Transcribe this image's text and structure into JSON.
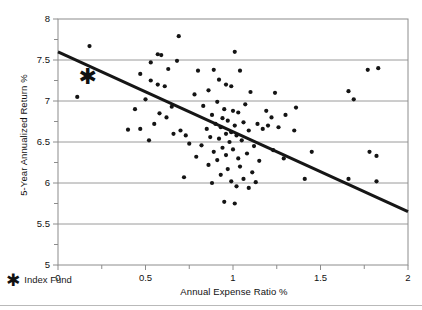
{
  "chart_data": {
    "type": "scatter",
    "title": "",
    "xlabel": "Annual Expense Ratio %",
    "ylabel": "5-Year Annualized Return %",
    "xlim": [
      0,
      2
    ],
    "ylim": [
      5,
      8
    ],
    "xticks": [
      0,
      0.5,
      1,
      1.5,
      2
    ],
    "xtick_labels": [
      "0",
      "0.5",
      "1",
      "1.5",
      "2"
    ],
    "yticks": [
      5,
      5.5,
      6,
      6.5,
      7,
      7.5,
      8
    ],
    "ytick_labels": [
      "5",
      "5.5",
      "6",
      "6.5",
      "7",
      "7.5",
      "8"
    ],
    "y_minor_ticks": [
      5.25,
      5.75,
      6.25,
      6.75,
      7.25,
      7.75
    ],
    "x_minor_ticks": [
      0.25,
      0.75,
      1.25,
      1.75
    ],
    "grid": "horizontal",
    "legend_position": "below-left",
    "series": [
      {
        "name": "Funds",
        "marker": "circle",
        "color": "#141414",
        "points": [
          [
            0.18,
            7.67
          ],
          [
            0.11,
            7.05
          ],
          [
            0.4,
            6.65
          ],
          [
            0.69,
            7.79
          ],
          [
            0.57,
            7.57
          ],
          [
            0.59,
            7.56
          ],
          [
            0.53,
            7.47
          ],
          [
            0.68,
            7.49
          ],
          [
            0.63,
            7.39
          ],
          [
            0.47,
            7.33
          ],
          [
            0.53,
            7.25
          ],
          [
            0.57,
            7.2
          ],
          [
            0.61,
            7.18
          ],
          [
            0.5,
            7.02
          ],
          [
            0.65,
            6.93
          ],
          [
            0.44,
            6.9
          ],
          [
            0.58,
            6.85
          ],
          [
            0.62,
            6.8
          ],
          [
            0.55,
            6.72
          ],
          [
            0.47,
            6.66
          ],
          [
            0.7,
            6.64
          ],
          [
            0.66,
            6.6
          ],
          [
            0.73,
            6.58
          ],
          [
            0.52,
            6.52
          ],
          [
            0.8,
            7.37
          ],
          [
            0.89,
            7.38
          ],
          [
            1.01,
            7.6
          ],
          [
            1.04,
            7.37
          ],
          [
            0.92,
            7.26
          ],
          [
            0.96,
            7.2
          ],
          [
            0.99,
            7.18
          ],
          [
            0.86,
            7.13
          ],
          [
            1.1,
            7.11
          ],
          [
            0.78,
            7.08
          ],
          [
            0.91,
            6.99
          ],
          [
            1.07,
            6.96
          ],
          [
            0.83,
            6.94
          ],
          [
            0.95,
            6.9
          ],
          [
            1.0,
            6.88
          ],
          [
            1.03,
            6.86
          ],
          [
            0.88,
            6.83
          ],
          [
            0.94,
            6.79
          ],
          [
            0.97,
            6.76
          ],
          [
            1.06,
            6.74
          ],
          [
            0.9,
            6.72
          ],
          [
            1.01,
            6.7
          ],
          [
            0.93,
            6.68
          ],
          [
            0.85,
            6.66
          ],
          [
            1.09,
            6.64
          ],
          [
            0.99,
            6.62
          ],
          [
            0.96,
            6.6
          ],
          [
            1.02,
            6.58
          ],
          [
            0.87,
            6.56
          ],
          [
            0.92,
            6.54
          ],
          [
            1.05,
            6.52
          ],
          [
            0.98,
            6.5
          ],
          [
            0.75,
            6.48
          ],
          [
            0.82,
            6.46
          ],
          [
            1.12,
            6.45
          ],
          [
            0.94,
            6.43
          ],
          [
            1.0,
            6.41
          ],
          [
            0.89,
            6.38
          ],
          [
            1.08,
            6.36
          ],
          [
            0.96,
            6.34
          ],
          [
            0.79,
            6.32
          ],
          [
            1.03,
            6.3
          ],
          [
            0.91,
            6.28
          ],
          [
            1.15,
            6.27
          ],
          [
            0.86,
            6.22
          ],
          [
            1.04,
            6.2
          ],
          [
            0.97,
            6.17
          ],
          [
            1.11,
            6.13
          ],
          [
            0.93,
            6.1
          ],
          [
            0.72,
            6.07
          ],
          [
            1.06,
            6.05
          ],
          [
            0.99,
            6.02
          ],
          [
            1.13,
            6.01
          ],
          [
            0.88,
            6.0
          ],
          [
            1.02,
            5.96
          ],
          [
            1.09,
            5.94
          ],
          [
            0.95,
            5.77
          ],
          [
            1.01,
            5.75
          ],
          [
            1.24,
            7.1
          ],
          [
            1.36,
            6.92
          ],
          [
            1.19,
            6.88
          ],
          [
            1.3,
            6.83
          ],
          [
            1.22,
            6.8
          ],
          [
            1.14,
            6.72
          ],
          [
            1.2,
            6.7
          ],
          [
            1.26,
            6.68
          ],
          [
            1.17,
            6.66
          ],
          [
            1.35,
            6.64
          ],
          [
            1.23,
            6.4
          ],
          [
            1.45,
            6.38
          ],
          [
            1.29,
            6.3
          ],
          [
            1.41,
            6.05
          ],
          [
            1.66,
            7.12
          ],
          [
            1.83,
            7.4
          ],
          [
            1.77,
            7.38
          ],
          [
            1.69,
            7.02
          ],
          [
            1.78,
            6.38
          ],
          [
            1.82,
            6.33
          ],
          [
            1.66,
            6.05
          ],
          [
            1.82,
            6.02
          ]
        ]
      }
    ],
    "index_fund": {
      "name": "Index Fund",
      "marker": "star",
      "x": 0.17,
      "y": 7.3,
      "color": "#111111"
    },
    "trendline": {
      "name": "Linear fit",
      "x0": 0,
      "y0": 7.6,
      "x1": 2,
      "y1": 5.65,
      "color": "#161616",
      "width": 3
    },
    "colors": {
      "grid": "#9a9a9a",
      "axis": "#8c8c8c",
      "marker": "#141414",
      "trend": "#161616",
      "text": "#111111",
      "background": "#ffffff"
    }
  },
  "legend": {
    "star_glyph": "✱",
    "label": "Index Fund"
  }
}
